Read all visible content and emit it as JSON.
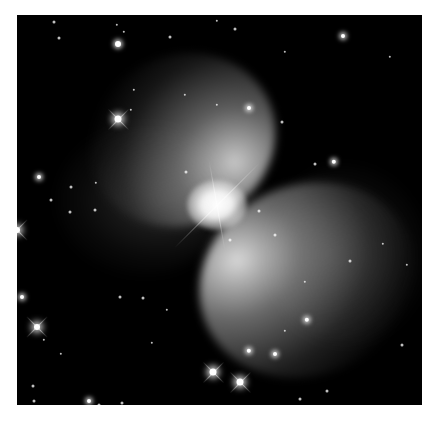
{
  "image": {
    "subject": "bipolar nebula",
    "palette": "grayscale",
    "background_color": "#000000",
    "frame_color": "#ffffff",
    "frame": {
      "left": 17,
      "top": 15,
      "width": 405,
      "height": 390
    }
  },
  "stars": [
    {
      "x": 37,
      "y": 7,
      "r": 1.5,
      "type": "dim"
    },
    {
      "x": 101,
      "y": 29,
      "r": 3,
      "type": "glow"
    },
    {
      "x": 42,
      "y": 23,
      "r": 1.5,
      "type": "dim"
    },
    {
      "x": 100,
      "y": 10,
      "r": 1.2,
      "type": "dim"
    },
    {
      "x": 107,
      "y": 17,
      "r": 1.2,
      "type": "dim"
    },
    {
      "x": 153,
      "y": 22,
      "r": 1.5,
      "type": "dim"
    },
    {
      "x": 200,
      "y": 6,
      "r": 1.2,
      "type": "dim"
    },
    {
      "x": 218,
      "y": 14,
      "r": 1.5,
      "type": "dim"
    },
    {
      "x": 326,
      "y": 21,
      "r": 2,
      "type": "glow"
    },
    {
      "x": 268,
      "y": 37,
      "r": 1.2,
      "type": "dim"
    },
    {
      "x": 373,
      "y": 42,
      "r": 1.2,
      "type": "dim"
    },
    {
      "x": 101,
      "y": 104,
      "r": 3.5,
      "type": "bright"
    },
    {
      "x": 114,
      "y": 95,
      "r": 1.2,
      "type": "dim"
    },
    {
      "x": 117,
      "y": 75,
      "r": 1.2,
      "type": "dim"
    },
    {
      "x": 168,
      "y": 80,
      "r": 1.2,
      "type": "dim"
    },
    {
      "x": 200,
      "y": 90,
      "r": 1.2,
      "type": "dim"
    },
    {
      "x": 232,
      "y": 93,
      "r": 2,
      "type": "glow"
    },
    {
      "x": 265,
      "y": 107,
      "r": 1.5,
      "type": "dim"
    },
    {
      "x": 0,
      "y": 215,
      "r": 3,
      "type": "bright"
    },
    {
      "x": 34,
      "y": 185,
      "r": 1.5,
      "type": "dim"
    },
    {
      "x": 22,
      "y": 162,
      "r": 2,
      "type": "glow"
    },
    {
      "x": 54,
      "y": 172,
      "r": 1.5,
      "type": "dim"
    },
    {
      "x": 53,
      "y": 197,
      "r": 1.5,
      "type": "dim"
    },
    {
      "x": 78,
      "y": 195,
      "r": 1.5,
      "type": "dim"
    },
    {
      "x": 79,
      "y": 168,
      "r": 1.2,
      "type": "dim"
    },
    {
      "x": 5,
      "y": 282,
      "r": 2,
      "type": "glow"
    },
    {
      "x": 20,
      "y": 312,
      "r": 3,
      "type": "bright"
    },
    {
      "x": 27,
      "y": 325,
      "r": 1.2,
      "type": "dim"
    },
    {
      "x": 44,
      "y": 339,
      "r": 1.2,
      "type": "dim"
    },
    {
      "x": 169,
      "y": 157,
      "r": 1.5,
      "type": "dim"
    },
    {
      "x": 213,
      "y": 225,
      "r": 1.5,
      "type": "dim"
    },
    {
      "x": 258,
      "y": 220,
      "r": 1.5,
      "type": "dim"
    },
    {
      "x": 298,
      "y": 149,
      "r": 1.5,
      "type": "dim"
    },
    {
      "x": 317,
      "y": 147,
      "r": 2.2,
      "type": "glow"
    },
    {
      "x": 366,
      "y": 229,
      "r": 1.2,
      "type": "dim"
    },
    {
      "x": 333,
      "y": 246,
      "r": 1.5,
      "type": "dim"
    },
    {
      "x": 288,
      "y": 267,
      "r": 1.2,
      "type": "dim"
    },
    {
      "x": 290,
      "y": 305,
      "r": 2.2,
      "type": "glow"
    },
    {
      "x": 242,
      "y": 196,
      "r": 1.5,
      "type": "dim"
    },
    {
      "x": 196,
      "y": 357,
      "r": 3.5,
      "type": "bright"
    },
    {
      "x": 223,
      "y": 367,
      "r": 3.5,
      "type": "bright"
    },
    {
      "x": 232,
      "y": 336,
      "r": 2.2,
      "type": "glow"
    },
    {
      "x": 258,
      "y": 339,
      "r": 2,
      "type": "glow"
    },
    {
      "x": 268,
      "y": 316,
      "r": 1.2,
      "type": "dim"
    },
    {
      "x": 283,
      "y": 384,
      "r": 1.5,
      "type": "dim"
    },
    {
      "x": 310,
      "y": 376,
      "r": 1.5,
      "type": "dim"
    },
    {
      "x": 330,
      "y": 394,
      "r": 1.5,
      "type": "dim"
    },
    {
      "x": 72,
      "y": 386,
      "r": 2,
      "type": "glow"
    },
    {
      "x": 82,
      "y": 390,
      "r": 1.5,
      "type": "dim"
    },
    {
      "x": 16,
      "y": 371,
      "r": 1.5,
      "type": "dim"
    },
    {
      "x": 17,
      "y": 386,
      "r": 1.5,
      "type": "dim"
    },
    {
      "x": 105,
      "y": 388,
      "r": 1.5,
      "type": "dim"
    },
    {
      "x": 126,
      "y": 283,
      "r": 1.5,
      "type": "dim"
    },
    {
      "x": 103,
      "y": 282,
      "r": 1.5,
      "type": "dim"
    },
    {
      "x": 135,
      "y": 328,
      "r": 1.2,
      "type": "dim"
    },
    {
      "x": 150,
      "y": 295,
      "r": 1.2,
      "type": "dim"
    },
    {
      "x": 385,
      "y": 330,
      "r": 1.5,
      "type": "dim"
    },
    {
      "x": 390,
      "y": 250,
      "r": 1.2,
      "type": "dim"
    }
  ],
  "spikes": [
    {
      "x": 200,
      "y": 190,
      "length": 120,
      "angle": -45
    },
    {
      "x": 200,
      "y": 190,
      "length": 90,
      "angle": 80
    }
  ]
}
